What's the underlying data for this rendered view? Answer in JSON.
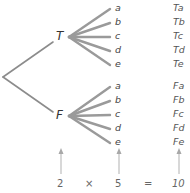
{
  "tree": {
    "first_stage": [
      "T",
      "F"
    ],
    "second_stage": [
      "a",
      "b",
      "c",
      "d",
      "e"
    ],
    "outcomes": {
      "T": [
        "Ta",
        "Tb",
        "Tc",
        "Td",
        "Te"
      ],
      "F": [
        "Fa",
        "Fb",
        "Fc",
        "Fd",
        "Fe"
      ]
    }
  },
  "equation": {
    "first": "2",
    "times": "×",
    "second": "5",
    "equals": "=",
    "result": "10"
  },
  "colors": {
    "branch": "#8c8c8c",
    "arrow": "#a0a0a0",
    "text": "#333333"
  }
}
